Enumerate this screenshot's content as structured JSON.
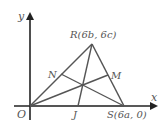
{
  "diagram": {
    "type": "coordinate-geometry-triangle-medians",
    "axes": {
      "x_label": "x",
      "y_label": "y",
      "origin_label": "O"
    },
    "points": {
      "O": {
        "label": "O",
        "px": [
          30,
          106
        ]
      },
      "R": {
        "label": "R(6b, 6c)",
        "px": [
          92,
          44
        ]
      },
      "S": {
        "label": "S(6a, 0)",
        "px": [
          124,
          106
        ]
      },
      "J": {
        "label": "J",
        "px": [
          78,
          106
        ]
      },
      "N": {
        "label": "N",
        "px": [
          61,
          74
        ]
      },
      "M": {
        "label": "M",
        "px": [
          108,
          75
        ]
      },
      "G": {
        "label": "",
        "px": [
          82,
          86
        ]
      }
    },
    "segments": [
      [
        "O",
        "R"
      ],
      [
        "R",
        "S"
      ],
      [
        "O",
        "S"
      ],
      [
        "R",
        "J"
      ],
      [
        "O",
        "M"
      ],
      [
        "S",
        "N"
      ]
    ],
    "colors": {
      "axis": "#222222",
      "triangle": "#555555",
      "label": "#555555"
    }
  }
}
